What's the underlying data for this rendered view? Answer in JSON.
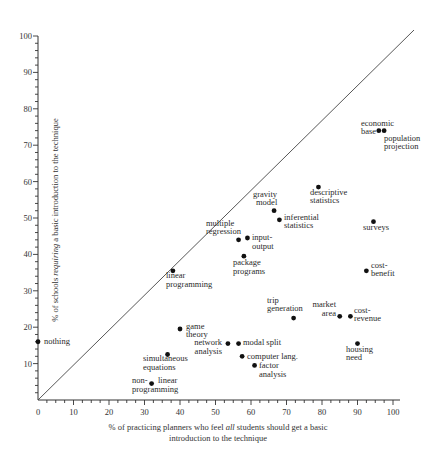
{
  "chart_data": {
    "type": "scatter",
    "title": "",
    "xlabel_line1": "% of practicing planners who feel all students should get a basic",
    "xlabel_line2": "introduction to the technique",
    "xlabel_italic_word": "all",
    "ylabel": "% of schools requiring a basic introduction to the technique",
    "ylabel_italic_word": "requiring",
    "xlim": [
      0,
      100
    ],
    "ylim": [
      0,
      100
    ],
    "x_ticks": [
      0,
      10,
      20,
      30,
      40,
      50,
      60,
      70,
      80,
      90,
      100
    ],
    "y_ticks": [
      10,
      20,
      30,
      40,
      50,
      60,
      70,
      80,
      90,
      100
    ],
    "grid": false,
    "reference_line": {
      "type": "diagonal",
      "equation": "y = x"
    },
    "points": [
      {
        "label": "nothing",
        "x": 0,
        "y": 16
      },
      {
        "label": "non-linear programming",
        "x": 32,
        "y": 4.5
      },
      {
        "label": "simultaneous equations",
        "x": 36.5,
        "y": 12.5
      },
      {
        "label": "game theory",
        "x": 40,
        "y": 19.5
      },
      {
        "label": "linear programming",
        "x": 38,
        "y": 35.5
      },
      {
        "label": "network analysis",
        "x": 53.5,
        "y": 15.5
      },
      {
        "label": "modal split",
        "x": 56.5,
        "y": 15.5
      },
      {
        "label": "computer lang.",
        "x": 57.5,
        "y": 12
      },
      {
        "label": "factor analysis",
        "x": 61,
        "y": 9.5
      },
      {
        "label": "multiple regression",
        "x": 56.5,
        "y": 44
      },
      {
        "label": "input-output",
        "x": 59,
        "y": 44.5
      },
      {
        "label": "package programs",
        "x": 58,
        "y": 39.5
      },
      {
        "label": "gravity model",
        "x": 66.5,
        "y": 52
      },
      {
        "label": "inferential statistics",
        "x": 68,
        "y": 49.5
      },
      {
        "label": "descriptive statistics",
        "x": 79,
        "y": 58.5
      },
      {
        "label": "trip generation",
        "x": 72,
        "y": 22.5
      },
      {
        "label": "market area",
        "x": 85,
        "y": 23
      },
      {
        "label": "cost-revenue",
        "x": 88,
        "y": 23
      },
      {
        "label": "housing need",
        "x": 90,
        "y": 15.5
      },
      {
        "label": "cost-benefit",
        "x": 92.5,
        "y": 35.5
      },
      {
        "label": "surveys",
        "x": 94.5,
        "y": 49
      },
      {
        "label": "economic base",
        "x": 96,
        "y": 74
      },
      {
        "label": "population projection",
        "x": 97.5,
        "y": 74
      }
    ]
  },
  "labels": {
    "x_ticks": [
      "0",
      "10",
      "20",
      "30",
      "40",
      "50",
      "60",
      "70",
      "80",
      "90",
      "100"
    ],
    "y_ticks": [
      "10",
      "20",
      "30",
      "40",
      "50",
      "60",
      "70",
      "80",
      "90",
      "100"
    ],
    "points": {
      "nothing": [
        "nothing"
      ],
      "nonlinear": [
        "non-",
        "programming"
      ],
      "nonlinear2": [
        "linear"
      ],
      "simultaneous": [
        "simultaneous",
        "equations"
      ],
      "game": [
        "game",
        "theory"
      ],
      "linear": [
        "linear",
        "programming"
      ],
      "network": [
        "network",
        "analysis"
      ],
      "modal": [
        "modal split"
      ],
      "computer": [
        "computer lang."
      ],
      "factor": [
        "factor",
        "analysis"
      ],
      "multiple": [
        "multiple",
        "regression"
      ],
      "inputoutput": [
        "input-",
        "output"
      ],
      "package": [
        "package",
        "programs"
      ],
      "gravity": [
        "gravity",
        "model"
      ],
      "inferential": [
        "inferential",
        "statistics"
      ],
      "descriptive": [
        "descriptive",
        "statistics"
      ],
      "trip": [
        "trip",
        "generation"
      ],
      "market": [
        "market",
        "area"
      ],
      "costrevenue": [
        "cost-",
        "revenue"
      ],
      "housing": [
        "housing",
        "need"
      ],
      "costbenefit": [
        "cost-",
        "benefit"
      ],
      "surveys": [
        "surveys"
      ],
      "economic": [
        "economic",
        "base"
      ],
      "population": [
        "population",
        "projection"
      ]
    },
    "xlabel_pre": "% of practicing planners who feel ",
    "xlabel_italic": "all",
    "xlabel_post": " students should get a basic",
    "xlabel_line2": "introduction to the technique",
    "ylabel_pre": "% of schools ",
    "ylabel_italic": "requiring",
    "ylabel_post": " a basic introduction to the technique"
  }
}
